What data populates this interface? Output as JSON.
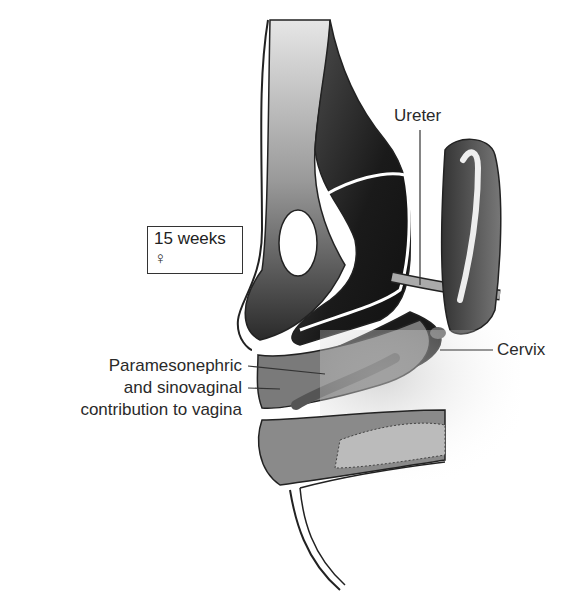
{
  "figure": {
    "stage_box": {
      "age": "15 weeks",
      "sex_symbol": "♀"
    },
    "labels": {
      "ureter": "Ureter",
      "cervix": "Cervix",
      "vagina_line1": "Paramesonephric",
      "vagina_line2": "and sinovaginal",
      "vagina_line3": "contribution to vagina"
    },
    "colors": {
      "dark_tissue": "#1e1e1e",
      "mid_tissue": "#7a7a7a",
      "light_tissue": "#d4d4d4",
      "outline": "#222222"
    }
  }
}
